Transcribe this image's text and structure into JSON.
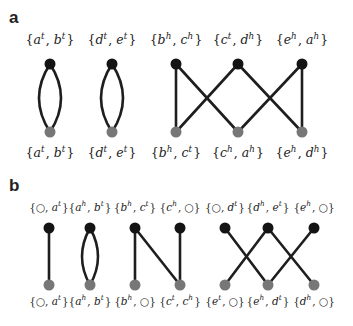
{
  "colors": {
    "top_node": "#141414",
    "bottom_node": "#777777",
    "edge": "#1e1e1e"
  },
  "panels": [
    {
      "label": "a",
      "top_labels": [
        {
          "p1": "a",
          "s1": "t",
          "p2": "b",
          "s2": "t"
        },
        {
          "p1": "d",
          "s1": "t",
          "p2": "e",
          "s2": "t"
        },
        {
          "p1": "b",
          "s1": "h",
          "p2": "c",
          "s2": "h"
        },
        {
          "p1": "c",
          "s1": "t",
          "p2": "d",
          "s2": "h"
        },
        {
          "p1": "e",
          "s1": "h",
          "p2": "a",
          "s2": "h"
        }
      ],
      "bottom_labels": [
        {
          "p1": "a",
          "s1": "t",
          "p2": "b",
          "s2": "t"
        },
        {
          "p1": "d",
          "s1": "t",
          "p2": "e",
          "s2": "t"
        },
        {
          "p1": "b",
          "s1": "h",
          "p2": "c",
          "s2": "t"
        },
        {
          "p1": "c",
          "s1": "h",
          "p2": "a",
          "s2": "h"
        },
        {
          "p1": "e",
          "s1": "h",
          "p2": "d",
          "s2": "h"
        }
      ],
      "edges": [
        {
          "top": 0,
          "bottom": 0,
          "curve": "left"
        },
        {
          "top": 0,
          "bottom": 0,
          "curve": "right"
        },
        {
          "top": 1,
          "bottom": 1,
          "curve": "left"
        },
        {
          "top": 1,
          "bottom": 1,
          "curve": "right"
        },
        {
          "top": 2,
          "bottom": 2,
          "curve": "none"
        },
        {
          "top": 2,
          "bottom": 3,
          "curve": "none"
        },
        {
          "top": 3,
          "bottom": 2,
          "curve": "none"
        },
        {
          "top": 3,
          "bottom": 4,
          "curve": "none"
        },
        {
          "top": 4,
          "bottom": 3,
          "curve": "none"
        },
        {
          "top": 4,
          "bottom": 4,
          "curve": "none"
        }
      ]
    },
    {
      "label": "b",
      "top_labels": [
        {
          "p1": "○",
          "s1": "",
          "p2": "a",
          "s2": "t"
        },
        {
          "p1": "a",
          "s1": "h",
          "p2": "b",
          "s2": "t"
        },
        {
          "p1": "b",
          "s1": "h",
          "p2": "c",
          "s2": "t"
        },
        {
          "p1": "c",
          "s1": "h",
          "p2": "○",
          "s2": ""
        },
        {
          "p1": "○",
          "s1": "",
          "p2": "d",
          "s2": "t"
        },
        {
          "p1": "d",
          "s1": "h",
          "p2": "e",
          "s2": "t"
        },
        {
          "p1": "e",
          "s1": "h",
          "p2": "○",
          "s2": ""
        }
      ],
      "bottom_labels": [
        {
          "p1": "○",
          "s1": "",
          "p2": "a",
          "s2": "t"
        },
        {
          "p1": "a",
          "s1": "h",
          "p2": "b",
          "s2": "t"
        },
        {
          "p1": "b",
          "s1": "h",
          "p2": "○",
          "s2": ""
        },
        {
          "p1": "c",
          "s1": "t",
          "p2": "c",
          "s2": "h"
        },
        {
          "p1": "e",
          "s1": "t",
          "p2": "○",
          "s2": ""
        },
        {
          "p1": "e",
          "s1": "h",
          "p2": "d",
          "s2": "t"
        },
        {
          "p1": "d",
          "s1": "h",
          "p2": "○",
          "s2": ""
        }
      ],
      "edges": [
        {
          "top": 0,
          "bottom": 0,
          "curve": "none"
        },
        {
          "top": 1,
          "bottom": 1,
          "curve": "left"
        },
        {
          "top": 1,
          "bottom": 1,
          "curve": "right"
        },
        {
          "top": 2,
          "bottom": 2,
          "curve": "none"
        },
        {
          "top": 2,
          "bottom": 3,
          "curve": "none"
        },
        {
          "top": 3,
          "bottom": 3,
          "curve": "none"
        },
        {
          "top": 4,
          "bottom": 5,
          "curve": "none"
        },
        {
          "top": 5,
          "bottom": 4,
          "curve": "none"
        },
        {
          "top": 5,
          "bottom": 6,
          "curve": "none"
        },
        {
          "top": 6,
          "bottom": 5,
          "curve": "none"
        }
      ]
    }
  ]
}
